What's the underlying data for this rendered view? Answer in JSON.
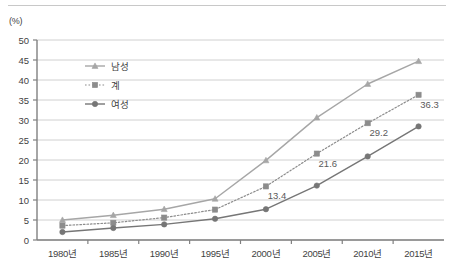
{
  "chart_data": {
    "type": "line",
    "title": "",
    "subtitle": "",
    "xlabel": "",
    "ylabel": "",
    "unit_label": "(%)",
    "categories": [
      "1980년",
      "1985년",
      "1990년",
      "1995년",
      "2000년",
      "2005년",
      "2010년",
      "2015년"
    ],
    "ylim": [
      0,
      50
    ],
    "ytick_step": 5,
    "yticks": [
      0,
      5,
      10,
      15,
      20,
      25,
      30,
      35,
      40,
      45,
      50
    ],
    "ytick_labels": [
      "0",
      "5",
      "10",
      "15",
      "20",
      "25",
      "30",
      "35",
      "40",
      "45",
      "50"
    ],
    "grid": true,
    "legend_position": "inside-upper-left",
    "series": [
      {
        "name": "남성",
        "marker": "triangle",
        "line_style": "solid",
        "color": "#a6a6a6",
        "values": [
          5.0,
          6.2,
          7.7,
          10.3,
          19.9,
          30.6,
          39.0,
          44.7
        ],
        "labels": [
          "",
          "",
          "",
          "",
          "",
          "",
          "",
          ""
        ]
      },
      {
        "name": "계",
        "marker": "square",
        "line_style": "dotted",
        "color": "#8c8c8c",
        "values": [
          3.6,
          4.3,
          5.6,
          7.6,
          13.4,
          21.6,
          29.2,
          36.3
        ],
        "labels": [
          "",
          "",
          "",
          "",
          "13.4",
          "21.6",
          "29.2",
          "36.3"
        ]
      },
      {
        "name": "여성",
        "marker": "circle",
        "line_style": "solid",
        "color": "#767676",
        "values": [
          2.0,
          3.0,
          3.9,
          5.3,
          7.7,
          13.6,
          20.9,
          28.4
        ],
        "labels": [
          "",
          "",
          "",
          "",
          "",
          "",
          "",
          ""
        ]
      }
    ],
    "colors": {
      "axis": "#808080",
      "grid": "#d0d0d0",
      "text": "#3f3f3f",
      "datalabel": "#5a5a5a",
      "male": "#a6a6a6",
      "total": "#8c8c8c",
      "female": "#767676",
      "background": "#ffffff",
      "top_rule": "#c8c8c8"
    }
  }
}
